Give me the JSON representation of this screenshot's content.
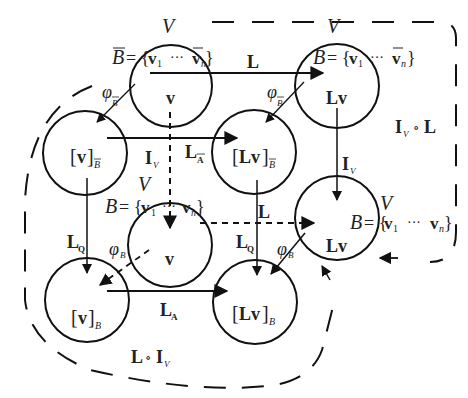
{
  "diagram": {
    "nodes": [
      {
        "id": "c1",
        "label": "v",
        "space": "V",
        "basis": "B̄ = {v1 ··· v̄n}"
      },
      {
        "id": "c2",
        "label": "Lv",
        "space": "V",
        "basis": "B = {v1 ··· v̄n}"
      },
      {
        "id": "c3",
        "label": "[v]",
        "label_sub": "B̄"
      },
      {
        "id": "c4",
        "label": "[Lv]",
        "label_sub": "B̄"
      },
      {
        "id": "c5",
        "label": "v",
        "space": "V",
        "basis": "B = {v1 ··· vn}"
      },
      {
        "id": "c6",
        "label": "Lv",
        "space": "V",
        "basis": "B = {v1 ··· vn}"
      },
      {
        "id": "c7",
        "label": "[v]",
        "label_sub": "B"
      },
      {
        "id": "c8",
        "label": "[Lv]",
        "label_sub": "B"
      }
    ],
    "edges": [
      {
        "from": "c1",
        "to": "c2",
        "label": "L",
        "style": "solid"
      },
      {
        "from": "c1",
        "to": "c3",
        "label": "φ",
        "label_sub": "B̄",
        "style": "solid"
      },
      {
        "from": "c2",
        "to": "c4",
        "label": "φ",
        "label_sub": "B̄",
        "style": "solid"
      },
      {
        "from": "c3",
        "to": "c4",
        "label": "L",
        "label_sub": "Ā",
        "style": "solid"
      },
      {
        "from": "c1",
        "to": "c5",
        "label": "I",
        "label_sub": "V",
        "style": "dashed"
      },
      {
        "from": "c2",
        "to": "c6",
        "label": "I",
        "label_sub": "V",
        "style": "solid"
      },
      {
        "from": "c5",
        "to": "c6",
        "label": "L",
        "style": "dashed"
      },
      {
        "from": "c3",
        "to": "c7",
        "label": "L",
        "label_sub": "Q",
        "style": "solid"
      },
      {
        "from": "c4",
        "to": "c8",
        "label": "L",
        "label_sub": "Q",
        "style": "solid"
      },
      {
        "from": "c5",
        "to": "c7",
        "label": "φ",
        "label_sub": "B",
        "style": "dashed"
      },
      {
        "from": "c6",
        "to": "c8",
        "label": "φ",
        "label_sub": "B",
        "style": "solid"
      },
      {
        "from": "c7",
        "to": "c8",
        "label": "L",
        "label_sub": "A",
        "style": "solid"
      }
    ],
    "regions": [
      {
        "id": "upper-right",
        "label": "I",
        "label_sub": "V",
        "op": "∘",
        "label2": "L"
      },
      {
        "id": "lower-left",
        "label": "L",
        "op": "∘",
        "label2": "I",
        "label2_sub": "V"
      }
    ],
    "text": {
      "V": "V",
      "Bbar": "B",
      "B": "B",
      "eq_open": "= {",
      "v1_v": "v",
      "v1_sub": "1",
      "dots": "···",
      "vn_v": "v",
      "vn_sub": "n",
      "close": "}",
      "v": "v",
      "Lv": "Lv",
      "lbr": "[",
      "rbr": "]",
      "L": "L",
      "I": "I",
      "phi": "φ",
      "sub_B": "B",
      "sub_V": "V",
      "sub_A": "A",
      "sub_Q": "Q",
      "circ": "∘"
    }
  }
}
